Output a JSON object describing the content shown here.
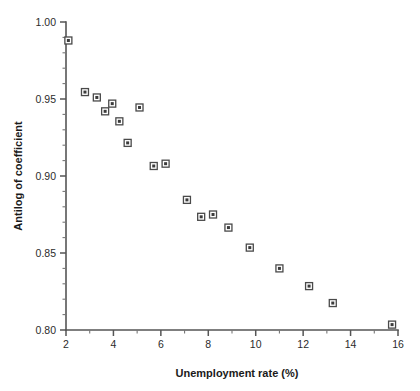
{
  "chart_data": {
    "type": "scatter",
    "title": "",
    "xlabel": "Unemployment rate (%)",
    "ylabel": "Antilog of coefficient",
    "xlim": [
      2,
      16
    ],
    "ylim": [
      0.8,
      1.0
    ],
    "grid": false,
    "legend": null,
    "x_major_ticks": [
      2,
      4,
      6,
      8,
      10,
      12,
      14,
      16
    ],
    "x_tick_labels": [
      "2",
      "4",
      "6",
      "8",
      "10",
      "12",
      "14",
      "16"
    ],
    "x_minor_interval": 1,
    "y_major_ticks": [
      0.8,
      0.85,
      0.9,
      0.95,
      1.0
    ],
    "y_tick_labels": [
      "0.80",
      "0.85",
      "0.90",
      "0.95",
      "1.00"
    ],
    "y_minor_interval": 0.01,
    "marker": "square",
    "marker_color": "#3b3b3b",
    "marker_edge_color": "#4a4a4a",
    "n_points": 19,
    "points": [
      {
        "x": 2.1,
        "y": 0.988
      },
      {
        "x": 2.8,
        "y": 0.9545
      },
      {
        "x": 3.3,
        "y": 0.951
      },
      {
        "x": 3.65,
        "y": 0.942
      },
      {
        "x": 3.95,
        "y": 0.947
      },
      {
        "x": 4.25,
        "y": 0.9355
      },
      {
        "x": 4.6,
        "y": 0.9215
      },
      {
        "x": 5.1,
        "y": 0.9445
      },
      {
        "x": 5.7,
        "y": 0.9065
      },
      {
        "x": 6.2,
        "y": 0.908
      },
      {
        "x": 7.1,
        "y": 0.8845
      },
      {
        "x": 7.7,
        "y": 0.8735
      },
      {
        "x": 8.2,
        "y": 0.875
      },
      {
        "x": 8.85,
        "y": 0.8665
      },
      {
        "x": 9.75,
        "y": 0.8535
      },
      {
        "x": 11.0,
        "y": 0.84
      },
      {
        "x": 12.25,
        "y": 0.8285
      },
      {
        "x": 13.25,
        "y": 0.8175
      },
      {
        "x": 15.75,
        "y": 0.8035
      }
    ]
  },
  "colors": {
    "background": "#ffffff",
    "axis": "#555555",
    "text": "#1a1a1a",
    "marker_fill": "#3b3b3b"
  }
}
